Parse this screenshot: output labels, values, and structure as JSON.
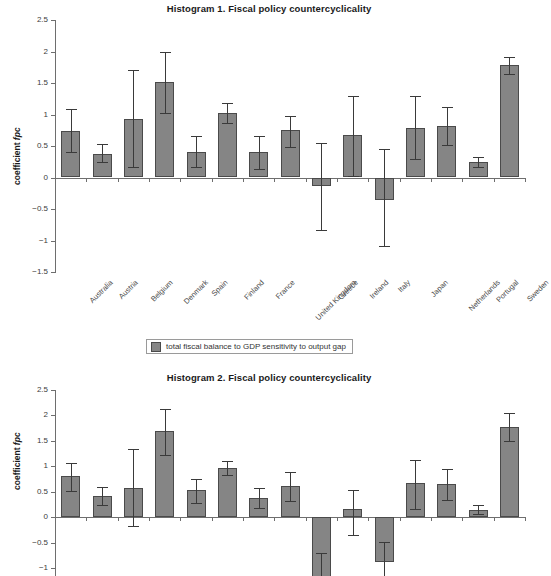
{
  "legend": {
    "label": "total fiscal balance to GDP sensitivity to output gap",
    "swatch_color": "#858585"
  },
  "style": {
    "bar_fill": "#858585",
    "bar_border": "#4a4a4a",
    "axis_color": "#6e6e6e",
    "error_bar_color": "#3a3a3a",
    "text_color": "#2b2b2b"
  },
  "chart_data": [
    {
      "type": "bar",
      "id": "histogram-1",
      "title": "Histogram 1. Fiscal policy countercyclicality",
      "xlabel": "",
      "ylabel": "coefficient fpc",
      "ylabel_plain": "coefficient ",
      "ylabel_italic": "fpc",
      "ylim": [
        -1.5,
        2.5
      ],
      "yticks": [
        2.5,
        2,
        1.5,
        1,
        0.5,
        0,
        -0.5,
        -1,
        -1.5
      ],
      "ytick_labels": [
        "2.5",
        "2",
        "1.5",
        "1",
        "0.5",
        "0",
        "−0.5",
        "−1",
        "−1.5"
      ],
      "grid": false,
      "legend_position": "below",
      "categories": [
        "Australia",
        "Austria",
        "Belgium",
        "Denmark",
        "Spain",
        "Finland",
        "France",
        "United Kingdom",
        "Greece",
        "Ireland",
        "Italy",
        "Japan",
        "Netherlands",
        "Portugal",
        "Sweden"
      ],
      "series": [
        {
          "name": "total fiscal balance to GDP sensitivity to output gap",
          "values": [
            0.74,
            0.38,
            0.93,
            1.51,
            0.41,
            1.02,
            0.4,
            0.76,
            -0.13,
            0.67,
            -0.36,
            0.79,
            0.81,
            0.24,
            1.78
          ],
          "err_low": [
            0.4,
            0.24,
            0.16,
            1.02,
            0.16,
            0.86,
            0.13,
            0.49,
            -0.83,
            0.03,
            -1.09,
            0.29,
            0.51,
            0.16,
            1.64
          ],
          "err_high": [
            1.08,
            0.53,
            1.7,
            2.0,
            0.66,
            1.18,
            0.66,
            0.97,
            0.54,
            1.3,
            0.46,
            1.29,
            1.12,
            0.33,
            1.92
          ]
        }
      ]
    },
    {
      "type": "bar",
      "id": "histogram-2",
      "title": "Histogram 2. Fiscal policy countercyclicality",
      "xlabel": "",
      "ylabel": "coefficient fpc",
      "ylabel_plain": "coefficient ",
      "ylabel_italic": "fpc",
      "ylim": [
        -1.5,
        2.5
      ],
      "visible_ylim": [
        -1.15,
        2.5
      ],
      "yticks": [
        2.5,
        2,
        1.5,
        1,
        0.5,
        0,
        -0.5,
        -1
      ],
      "ytick_labels": [
        "2.5",
        "2",
        "1.5",
        "1",
        "0.5",
        "0",
        "−0.5",
        "−1"
      ],
      "grid": false,
      "legend_position": "none",
      "categories": [
        "Australia",
        "Austria",
        "Belgium",
        "Denmark",
        "Spain",
        "Finland",
        "France",
        "United Kingdom",
        "Greece",
        "Ireland",
        "Italy",
        "Japan",
        "Netherlands",
        "Portugal",
        "Sweden"
      ],
      "series": [
        {
          "name": "total fiscal balance to GDP sensitivity to output gap",
          "values": [
            0.81,
            0.42,
            0.58,
            1.69,
            0.54,
            0.96,
            0.39,
            0.62,
            -1.3,
            0.16,
            -0.88,
            0.68,
            0.66,
            0.14,
            1.77
          ],
          "err_low": [
            0.52,
            0.24,
            -0.16,
            1.22,
            0.28,
            0.83,
            0.19,
            0.33,
            -1.6,
            -0.35,
            -1.4,
            0.16,
            0.34,
            0.06,
            1.49
          ],
          "err_high": [
            1.07,
            0.6,
            1.34,
            2.13,
            0.75,
            1.1,
            0.58,
            0.9,
            -0.7,
            0.54,
            -0.48,
            1.13,
            0.95,
            0.25,
            2.04
          ]
        }
      ]
    }
  ]
}
